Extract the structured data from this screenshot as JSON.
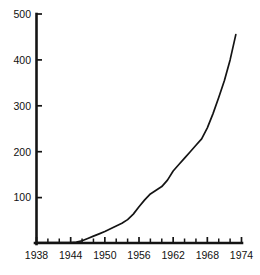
{
  "chart": {
    "title": "",
    "subtitle": "",
    "accent_color": "#141414",
    "background_color": "#ffffff"
  },
  "chart_data": {
    "type": "line",
    "title": "",
    "xlabel": "",
    "ylabel": "",
    "xlim": [
      1938,
      1974
    ],
    "ylim": [
      0,
      500
    ],
    "grid": false,
    "legend": false,
    "x_tick_labels": [
      "1938",
      "1944",
      "1950",
      "1956",
      "1962",
      "1968",
      "1974"
    ],
    "x_tick_values": [
      1938,
      1944,
      1950,
      1956,
      1962,
      1968,
      1974
    ],
    "x_minor_tick_values": [
      1940,
      1942,
      1946,
      1948,
      1952,
      1954,
      1958,
      1960,
      1964,
      1966,
      1970,
      1972
    ],
    "y_tick_labels": [
      "100",
      "200",
      "300",
      "400",
      "500"
    ],
    "y_tick_values": [
      100,
      200,
      300,
      400,
      500
    ],
    "series": [
      {
        "name": "series-1",
        "color": "#141414",
        "x": [
          1938,
          1940,
          1942,
          1944,
          1945,
          1946,
          1947,
          1948,
          1949,
          1950,
          1951,
          1952,
          1953,
          1954,
          1955,
          1956,
          1957,
          1958,
          1959,
          1960,
          1961,
          1962,
          1963,
          1964,
          1965,
          1966,
          1967,
          1968,
          1969,
          1970,
          1971,
          1972,
          1973
        ],
        "y": [
          2,
          2,
          2,
          2,
          3,
          6,
          11,
          16,
          21,
          26,
          32,
          38,
          44,
          52,
          64,
          80,
          95,
          108,
          116,
          124,
          138,
          158,
          172,
          186,
          200,
          214,
          228,
          252,
          283,
          318,
          355,
          400,
          455
        ]
      }
    ]
  }
}
